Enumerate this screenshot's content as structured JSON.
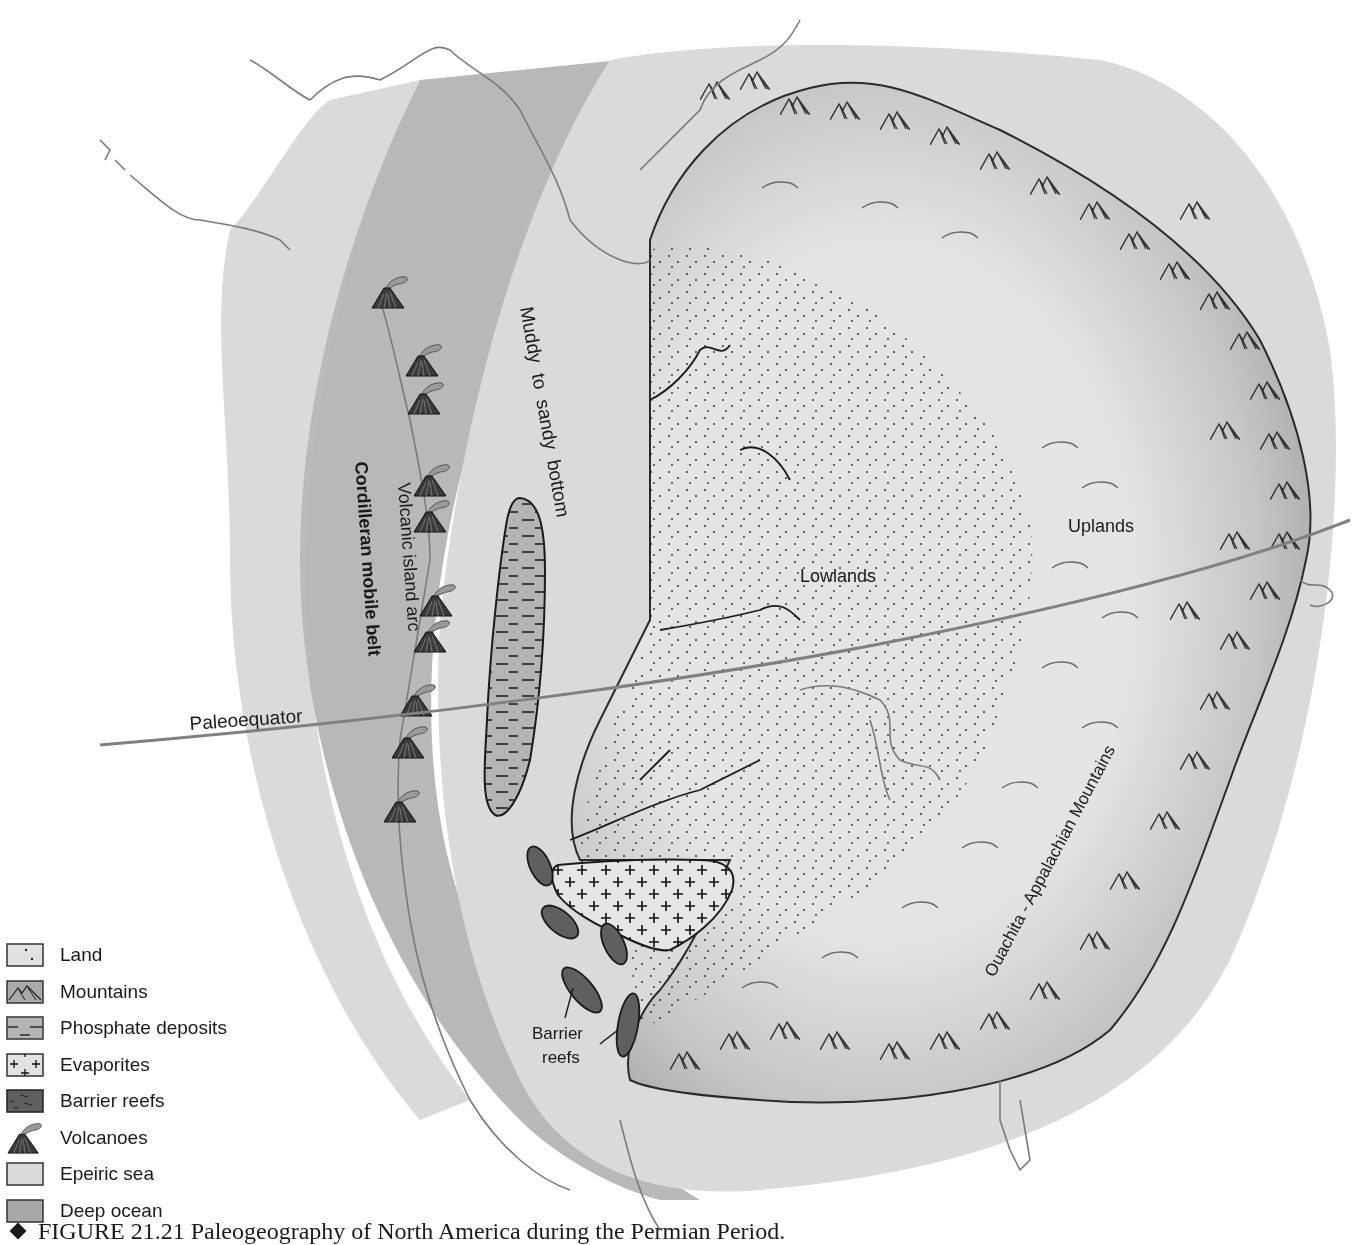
{
  "figure": {
    "caption_number": "FIGURE 21.21",
    "caption_text": "Paleogeography of North America during the Permian Period.",
    "caption_full": "FIGURE 21.21  Paleogeography of North America during the Permian Period."
  },
  "map": {
    "labels": {
      "muddy_bottom": "Muddy  to  sandy  bottom",
      "volcanic_arc": "Volcanic island arc",
      "cordilleran": "Cordilleran mobile belt",
      "paleoequator": "Paleoequator",
      "lowlands": "Lowlands",
      "uplands": "Uplands",
      "appalachian": "Ouachita - Appalachian Mountains",
      "barrier_reefs_line1": "Barrier",
      "barrier_reefs_line2": "reefs"
    },
    "volcano_count": 11,
    "barrier_reef_count": 5,
    "colors": {
      "deep_ocean": "#a8a8a8",
      "epeiric_sea": "#dcdcdc",
      "land": "#e2e2e2",
      "mountains": "#a9a9a9",
      "phosphate": "#b4b4b4",
      "barrier_reef": "#5f5f5f",
      "outline": "#7a7a7a",
      "equator": "#808080",
      "ink": "#1a1a1a"
    }
  },
  "legend": {
    "items": [
      {
        "key": "land",
        "label": "Land"
      },
      {
        "key": "mountains",
        "label": "Mountains"
      },
      {
        "key": "phosphate",
        "label": "Phosphate deposits"
      },
      {
        "key": "evaporites",
        "label": "Evaporites"
      },
      {
        "key": "barrier_reefs",
        "label": "Barrier reefs"
      },
      {
        "key": "volcanoes",
        "label": "Volcanoes"
      },
      {
        "key": "epeiric_sea",
        "label": "Epeiric sea"
      },
      {
        "key": "deep_ocean",
        "label": "Deep ocean"
      }
    ]
  }
}
